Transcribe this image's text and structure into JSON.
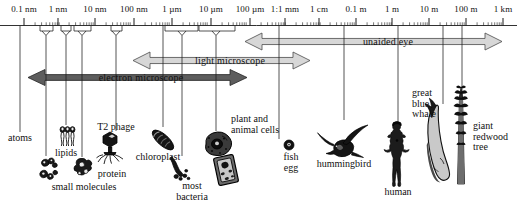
{
  "figure": {
    "caption": "Size range of cells and biological structures"
  },
  "scale": {
    "labels": [
      "0.1 nm",
      "1 nm",
      "10 nm",
      "100 nm",
      "1 µm",
      "10 µm",
      "100 µm",
      "1:1 mm",
      "1 cm",
      "0.1 m",
      "1 m",
      "10 m",
      "100 m",
      "1 km"
    ],
    "positions": [
      24,
      58,
      95,
      134,
      172,
      211,
      250,
      285,
      319,
      356,
      392,
      429,
      466,
      503
    ]
  },
  "ranges": [
    {
      "name": "unaided-eye",
      "label": "unaided eye",
      "x1": 245,
      "x2": 502,
      "cy": 41.5,
      "h": 17,
      "tone": "light",
      "text_x": 388
    },
    {
      "name": "light-microscope",
      "label": "light microscope",
      "x1": 133,
      "x2": 310,
      "cy": 60.5,
      "h": 17,
      "tone": "light",
      "text_x": 230
    },
    {
      "name": "electron-microscope",
      "label": "electron microscope",
      "x1": 28,
      "x2": 247,
      "cy": 77.5,
      "h": 16,
      "tone": "dark",
      "text_x": 141
    }
  ],
  "leaders": [
    {
      "name": "atoms",
      "type": "line",
      "x": 20,
      "end": 132
    },
    {
      "name": "small-molecules",
      "type": "bracket",
      "left": 40,
      "right": 53,
      "cx": 46,
      "end": 156
    },
    {
      "name": "lipids",
      "type": "bracket",
      "left": 61,
      "right": 71,
      "cx": 66,
      "end": 125
    },
    {
      "name": "protein",
      "type": "bracket",
      "left": 74,
      "right": 91,
      "cx": 82,
      "end": 157
    },
    {
      "name": "t2-phage",
      "type": "bracket",
      "left": 111,
      "right": 122,
      "cx": 116,
      "end": 131
    },
    {
      "name": "chloroplast",
      "type": "line",
      "x": 163,
      "end": 127
    },
    {
      "name": "most-bacteria",
      "type": "bracket",
      "left": 165,
      "right": 198,
      "cx": 182,
      "end": 156
    },
    {
      "name": "plant-and-animal-cells",
      "type": "bracket",
      "left": 199,
      "right": 235,
      "cx": 216,
      "end": 131
    },
    {
      "name": "fish-egg",
      "type": "line",
      "x": 279,
      "end": 139
    },
    {
      "name": "hummingbird",
      "type": "line",
      "x": 344,
      "end": 120
    },
    {
      "name": "human",
      "type": "line",
      "x": 398,
      "end": 122
    },
    {
      "name": "great-blue-whale",
      "type": "line",
      "x": 443,
      "end": 104
    },
    {
      "name": "giant-redwood-tree",
      "type": "line",
      "x": 462,
      "end": 95
    }
  ],
  "items": [
    {
      "name": "atoms",
      "lines": [
        "atoms"
      ],
      "x": 20,
      "y": 133,
      "align": "center"
    },
    {
      "name": "lipids",
      "lines": [
        "lipids"
      ],
      "x": 66,
      "y": 148,
      "align": "center"
    },
    {
      "name": "small-molecules",
      "lines": [
        "small molecules"
      ],
      "x": 84,
      "y": 182,
      "align": "center"
    },
    {
      "name": "protein",
      "lines": [
        "protein"
      ],
      "x": 112,
      "y": 169,
      "align": "center"
    },
    {
      "name": "t2-phage",
      "lines": [
        "T2 phage"
      ],
      "x": 116,
      "y": 122,
      "align": "center"
    },
    {
      "name": "chloroplast",
      "lines": [
        "chloroplast"
      ],
      "x": 158,
      "y": 152,
      "align": "center"
    },
    {
      "name": "most-bacteria",
      "lines": [
        "most",
        "bacteria"
      ],
      "x": 192,
      "y": 181,
      "align": "center"
    },
    {
      "name": "plant-and-animal-cells",
      "lines": [
        "plant and",
        "animal cells"
      ],
      "x": 231,
      "y": 114,
      "align": "left"
    },
    {
      "name": "fish-egg",
      "lines": [
        "fish",
        "egg"
      ],
      "x": 291,
      "y": 152,
      "align": "center"
    },
    {
      "name": "hummingbird",
      "lines": [
        "hummingbird"
      ],
      "x": 344,
      "y": 159,
      "align": "center"
    },
    {
      "name": "human",
      "lines": [
        "human"
      ],
      "x": 398,
      "y": 187,
      "align": "center"
    },
    {
      "name": "great-blue-whale",
      "lines": [
        "great",
        "blue",
        "whale"
      ],
      "x": 412,
      "y": 88,
      "align": "left"
    },
    {
      "name": "giant-redwood-tree",
      "lines": [
        "giant",
        "redwood",
        "tree"
      ],
      "x": 473,
      "y": 121,
      "align": "left"
    }
  ],
  "colors": {
    "rule": "#1b1b1b",
    "light_arrow_fill": "#d7d7d7",
    "light_arrow_stroke": "#4a4a4a",
    "dark_arrow_fill": "#5d5d5d",
    "dark_arrow_stroke": "#242424",
    "ink": "#111111"
  }
}
